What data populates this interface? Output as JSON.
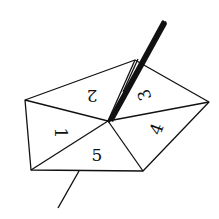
{
  "diagram": {
    "type": "spinner",
    "colors": {
      "stroke": "#111111",
      "background": "#ffffff"
    },
    "sections": [
      {
        "label": "1",
        "rotation": 90
      },
      {
        "label": "2",
        "rotation": 180
      },
      {
        "label": "3",
        "rotation": -110
      },
      {
        "label": "4",
        "rotation": -70
      },
      {
        "label": "5",
        "rotation": 0
      }
    ]
  }
}
